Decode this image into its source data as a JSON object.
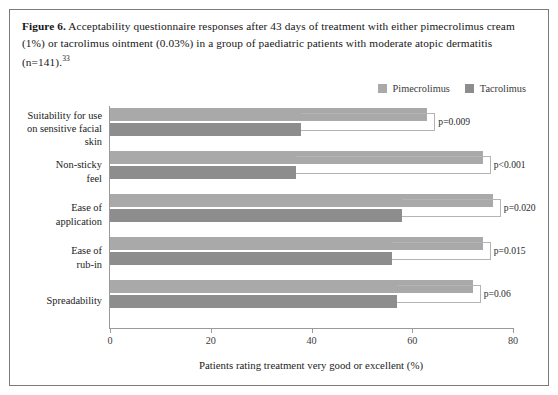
{
  "figure": {
    "label": "Figure 6.",
    "caption_text": " Acceptability questionnaire responses after 43 days of treatment with either pimecrolimus cream (1%) or tacrolimus ointment (0.03%) in a group of paediatric patients with moderate atopic dermatitis (n=141).",
    "reference": "33"
  },
  "colors": {
    "pimecrolimus": "#a9a9a9",
    "tacrolimus": "#8d8d8d",
    "axis": "#9a9a9a",
    "bracket": "#b4b4b4",
    "border": "#7a7a7a"
  },
  "legend": {
    "position": "top-right",
    "items": [
      {
        "label": "Pimecrolimus",
        "color": "#a9a9a9"
      },
      {
        "label": "Tacrolimus",
        "color": "#8d8d8d"
      }
    ]
  },
  "chart_data": {
    "type": "bar",
    "orientation": "horizontal",
    "title": "",
    "xlabel": "Patients rating treatment very good or excellent (%)",
    "ylabel": "",
    "xlim": [
      0,
      80
    ],
    "xticks": [
      0,
      20,
      40,
      60,
      80
    ],
    "xtick_labels": [
      "0",
      "20",
      "40",
      "60",
      "80"
    ],
    "grid": false,
    "categories": [
      "Suitability for use on sensitive facial skin",
      "Non-sticky feel",
      "Ease of application",
      "Ease of rub-in",
      "Spreadability"
    ],
    "category_lines": [
      [
        "Suitability for use",
        "on sensitive facial",
        "skin"
      ],
      [
        "Non-sticky",
        "feel"
      ],
      [
        "Ease of",
        "application"
      ],
      [
        "Ease of",
        "rub-in"
      ],
      [
        "Spreadability"
      ]
    ],
    "series": [
      {
        "name": "Pimecrolimus",
        "color": "#a9a9a9",
        "values": [
          63,
          74,
          76,
          74,
          72
        ]
      },
      {
        "name": "Tacrolimus",
        "color": "#8d8d8d",
        "values": [
          38,
          37,
          58,
          56,
          57
        ]
      }
    ],
    "annotations": [
      {
        "category": "Suitability for use on sensitive facial skin",
        "text": "p=0.009"
      },
      {
        "category": "Non-sticky feel",
        "text": "p<0.001"
      },
      {
        "category": "Ease of application",
        "text": "p=0.020"
      },
      {
        "category": "Ease of rub-in",
        "text": "p=0.015"
      },
      {
        "category": "Spreadability",
        "text": "p=0.06"
      }
    ]
  }
}
